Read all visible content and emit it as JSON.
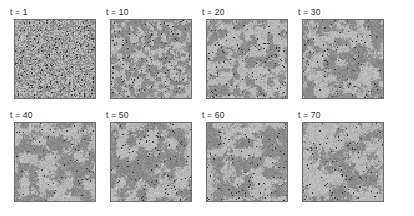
{
  "figure": {
    "name": "coarsening-snapshot-grid",
    "background_color": "#ffffff",
    "rows": 2,
    "columns": 4,
    "panel_count": 8
  },
  "palette": {
    "light_domain": "#b8b8b8",
    "dark_domain": "#8b8b8b",
    "mid_domain": "#a2a2a2",
    "speck": "#3a3a3a",
    "panel_border": "#6f6f6f",
    "label_text": "#2d2d2d"
  },
  "panels": [
    {
      "id": "panel-t1",
      "label": "t = 1",
      "time": 1,
      "row": 0,
      "column": 0,
      "grid_cells": 64,
      "domain_scale": 1.0,
      "light_fraction": 0.5,
      "speck_density": 0.055,
      "seed": 11
    },
    {
      "id": "panel-t10",
      "label": "t = 10",
      "time": 10,
      "row": 0,
      "column": 1,
      "grid_cells": 64,
      "domain_scale": 3.2,
      "light_fraction": 0.52,
      "speck_density": 0.03,
      "seed": 27
    },
    {
      "id": "panel-t20",
      "label": "t = 20",
      "time": 20,
      "row": 0,
      "column": 2,
      "grid_cells": 64,
      "domain_scale": 4.6,
      "light_fraction": 0.54,
      "speck_density": 0.024,
      "seed": 43
    },
    {
      "id": "panel-t30",
      "label": "t = 30",
      "time": 30,
      "row": 0,
      "column": 3,
      "grid_cells": 64,
      "domain_scale": 5.8,
      "light_fraction": 0.5,
      "speck_density": 0.02,
      "seed": 59
    },
    {
      "id": "panel-t40",
      "label": "t = 40",
      "time": 40,
      "row": 1,
      "column": 0,
      "grid_cells": 64,
      "domain_scale": 6.8,
      "light_fraction": 0.52,
      "speck_density": 0.018,
      "seed": 71
    },
    {
      "id": "panel-t50",
      "label": "t = 50",
      "time": 50,
      "row": 1,
      "column": 1,
      "grid_cells": 64,
      "domain_scale": 7.6,
      "light_fraction": 0.55,
      "speck_density": 0.022,
      "seed": 89
    },
    {
      "id": "panel-t60",
      "label": "t = 60",
      "time": 60,
      "row": 1,
      "column": 2,
      "grid_cells": 64,
      "domain_scale": 8.4,
      "light_fraction": 0.56,
      "speck_density": 0.02,
      "seed": 101
    },
    {
      "id": "panel-t70",
      "label": "t = 70",
      "time": 70,
      "row": 1,
      "column": 3,
      "grid_cells": 64,
      "domain_scale": 9.2,
      "light_fraction": 0.54,
      "speck_density": 0.019,
      "seed": 127
    }
  ],
  "chart_data": {
    "type": "heatmap",
    "title": "",
    "xlabel": "",
    "ylabel": "",
    "panel_labels": [
      "t = 1",
      "t = 10",
      "t = 20",
      "t = 30",
      "t = 40",
      "t = 50",
      "t = 60",
      "t = 70"
    ],
    "time_values": [
      1,
      10,
      20,
      30,
      40,
      50,
      60,
      70
    ],
    "grid_layout": [
      4,
      2
    ],
    "lattice_size": [
      64,
      64
    ],
    "value_levels": [
      "dark",
      "mid",
      "light",
      "speck"
    ],
    "legend": "none",
    "grid": false
  }
}
